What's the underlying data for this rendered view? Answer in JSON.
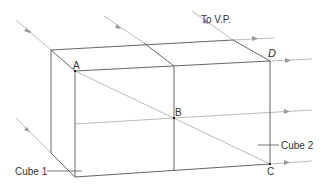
{
  "diagram": {
    "labels": {
      "vp": "To V.P.",
      "A": "A",
      "B": "B",
      "C": "C",
      "D": "D",
      "cube1": "Cube 1",
      "cube2": "Cube 2"
    },
    "colors": {
      "edge": "#555555",
      "ray": "#a8a8a8",
      "text": "#333333"
    }
  }
}
